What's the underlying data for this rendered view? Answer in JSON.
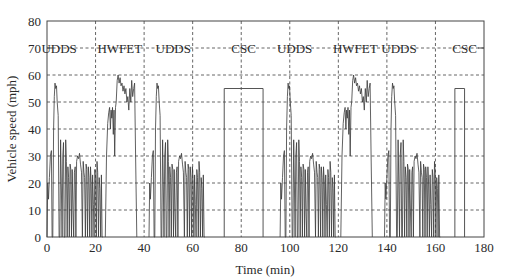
{
  "chart_data": {
    "type": "line",
    "title": "",
    "xlabel": "Time (min)",
    "ylabel": "Vehicle speed (mph)",
    "xlim": [
      0,
      180
    ],
    "ylim": [
      0,
      80
    ],
    "xticks": [
      0,
      20,
      40,
      60,
      80,
      100,
      120,
      140,
      160,
      180
    ],
    "yticks": [
      0,
      10,
      20,
      30,
      40,
      50,
      60,
      70,
      80
    ],
    "grid": true,
    "legend": null,
    "cycle_boundaries_min": [
      20,
      40,
      60,
      80,
      100,
      120,
      140,
      160
    ],
    "cycles": [
      {
        "name": "UDDS",
        "start": 0,
        "end": 23,
        "peak_speed": 57,
        "label_x": 5
      },
      {
        "name": "HWFET",
        "start": 24,
        "end": 37,
        "peak_speed": 60,
        "label_x": 30
      },
      {
        "name": "UDDS",
        "start": 42,
        "end": 65,
        "peak_speed": 57,
        "label_x": 52
      },
      {
        "name": "CSC",
        "start": 73,
        "end": 89,
        "peak_speed": 55,
        "label_x": 81,
        "type": "constant"
      },
      {
        "name": "UDDS",
        "start": 96,
        "end": 119,
        "peak_speed": 57,
        "label_x": 102
      },
      {
        "name": "HWFET",
        "start": 121,
        "end": 134,
        "peak_speed": 60,
        "label_x": 127
      },
      {
        "name": "UDDS",
        "start": 139,
        "end": 162,
        "peak_speed": 57,
        "label_x": 145
      },
      {
        "name": "CSC",
        "start": 168,
        "end": 172,
        "peak_speed": 55,
        "label_x": 172,
        "type": "constant"
      }
    ],
    "series": [
      {
        "name": "Vehicle speed",
        "color": "#3a3a3a",
        "udds_profile": [
          [
            0,
            0
          ],
          [
            0.3,
            20
          ],
          [
            0.6,
            14
          ],
          [
            1,
            22
          ],
          [
            1.4,
            30
          ],
          [
            1.8,
            32
          ],
          [
            2.1,
            0
          ],
          [
            2.4,
            0
          ],
          [
            2.7,
            40
          ],
          [
            3.0,
            52
          ],
          [
            3.3,
            57
          ],
          [
            3.6,
            55
          ],
          [
            3.9,
            56
          ],
          [
            4.2,
            50
          ],
          [
            4.6,
            45
          ],
          [
            5.0,
            0
          ],
          [
            5.3,
            0
          ],
          [
            5.6,
            36
          ],
          [
            5.9,
            20
          ],
          [
            6.2,
            0
          ],
          [
            6.5,
            30
          ],
          [
            6.8,
            35
          ],
          [
            7.1,
            0
          ],
          [
            7.4,
            0
          ],
          [
            7.7,
            36
          ],
          [
            8.0,
            28
          ],
          [
            8.3,
            0
          ],
          [
            8.6,
            26
          ],
          [
            8.9,
            22
          ],
          [
            9.2,
            0
          ],
          [
            9.5,
            27
          ],
          [
            9.8,
            25
          ],
          [
            10.1,
            0
          ],
          [
            10.4,
            25
          ],
          [
            10.7,
            10
          ],
          [
            11.0,
            0
          ],
          [
            11.3,
            24
          ],
          [
            11.6,
            26
          ],
          [
            11.9,
            0
          ],
          [
            12.2,
            28
          ],
          [
            12.6,
            30
          ],
          [
            13.0,
            29
          ],
          [
            13.4,
            31
          ],
          [
            13.8,
            27
          ],
          [
            14.2,
            24
          ],
          [
            14.6,
            0
          ],
          [
            14.9,
            28
          ],
          [
            15.2,
            24
          ],
          [
            15.5,
            22
          ],
          [
            15.8,
            0
          ],
          [
            16.1,
            27
          ],
          [
            16.4,
            25
          ],
          [
            16.7,
            0
          ],
          [
            17.0,
            26
          ],
          [
            17.3,
            22
          ],
          [
            17.6,
            0
          ],
          [
            17.9,
            26
          ],
          [
            18.2,
            20
          ],
          [
            18.5,
            0
          ],
          [
            18.8,
            23
          ],
          [
            19.1,
            12
          ],
          [
            19.4,
            0
          ],
          [
            19.7,
            25
          ],
          [
            20.0,
            22
          ],
          [
            20.3,
            0
          ],
          [
            20.6,
            28
          ],
          [
            20.9,
            24
          ],
          [
            21.2,
            0
          ],
          [
            21.5,
            22
          ],
          [
            21.8,
            18
          ],
          [
            22.1,
            0
          ],
          [
            22.4,
            23
          ],
          [
            22.7,
            0
          ],
          [
            23,
            0
          ]
        ],
        "hwfet_profile": [
          [
            0,
            0
          ],
          [
            0.5,
            30
          ],
          [
            1.0,
            42
          ],
          [
            1.4,
            46
          ],
          [
            1.8,
            48
          ],
          [
            2.1,
            40
          ],
          [
            2.4,
            47
          ],
          [
            2.7,
            44
          ],
          [
            3.0,
            48
          ],
          [
            3.3,
            38
          ],
          [
            3.6,
            47
          ],
          [
            3.9,
            30
          ],
          [
            4.2,
            48
          ],
          [
            4.5,
            50
          ],
          [
            4.9,
            58
          ],
          [
            5.3,
            60
          ],
          [
            5.7,
            57
          ],
          [
            6.1,
            59
          ],
          [
            6.5,
            56
          ],
          [
            6.9,
            57
          ],
          [
            7.3,
            54
          ],
          [
            7.7,
            56
          ],
          [
            8.1,
            53
          ],
          [
            8.5,
            55
          ],
          [
            8.9,
            50
          ],
          [
            9.3,
            52
          ],
          [
            9.7,
            47
          ],
          [
            10.1,
            55
          ],
          [
            10.5,
            50
          ],
          [
            10.9,
            58
          ],
          [
            11.3,
            52
          ],
          [
            11.7,
            55
          ],
          [
            12.1,
            57
          ],
          [
            12.5,
            30
          ],
          [
            13,
            0
          ]
        ],
        "csc_speed": 55
      }
    ]
  },
  "axes": {
    "x_label": "Time (min)",
    "y_label": "Vehicle speed (mph)",
    "x_tick_labels": [
      "0",
      "20",
      "40",
      "60",
      "80",
      "100",
      "120",
      "140",
      "160",
      "180"
    ],
    "y_tick_labels": [
      "0",
      "10",
      "20",
      "30",
      "40",
      "50",
      "60",
      "70",
      "80"
    ]
  },
  "cycle_labels": [
    "UDDS",
    "HWFET",
    "UDDS",
    "CSC",
    "UDDS",
    "HWFET",
    "UDDS",
    "CSC"
  ]
}
